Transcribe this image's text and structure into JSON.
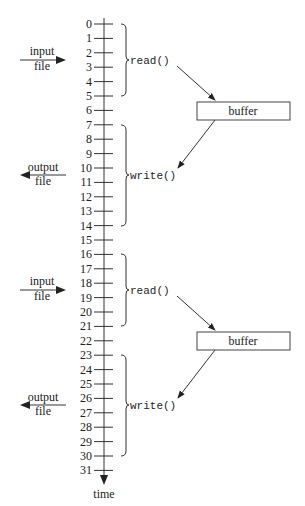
{
  "diagram": {
    "axis": {
      "label": "time",
      "ticks": [
        "0",
        "1",
        "2",
        "3",
        "4",
        "5",
        "6",
        "7",
        "8",
        "9",
        "10",
        "11",
        "12",
        "13",
        "14",
        "15",
        "16",
        "17",
        "18",
        "19",
        "20",
        "21",
        "22",
        "23",
        "24",
        "25",
        "26",
        "27",
        "28",
        "29",
        "30",
        "31"
      ]
    },
    "phases": [
      {
        "operation": "read()",
        "range": [
          0,
          5
        ],
        "file_label_line1": "input",
        "file_label_line2": "file",
        "direction": "in",
        "buffer_label": "buffer"
      },
      {
        "operation": "write()",
        "range": [
          7,
          14
        ],
        "file_label_line1": "output",
        "file_label_line2": "file",
        "direction": "out"
      },
      {
        "operation": "read()",
        "range": [
          16,
          21
        ],
        "file_label_line1": "input",
        "file_label_line2": "file",
        "direction": "in",
        "buffer_label": "buffer"
      },
      {
        "operation": "write()",
        "range": [
          23,
          30
        ],
        "file_label_line1": "output",
        "file_label_line2": "file",
        "direction": "out"
      }
    ],
    "caption_partial": "(caption clipped at bottom edge)"
  },
  "colors": {
    "line": "#333333",
    "text": "#222222",
    "background": "#ffffff"
  }
}
